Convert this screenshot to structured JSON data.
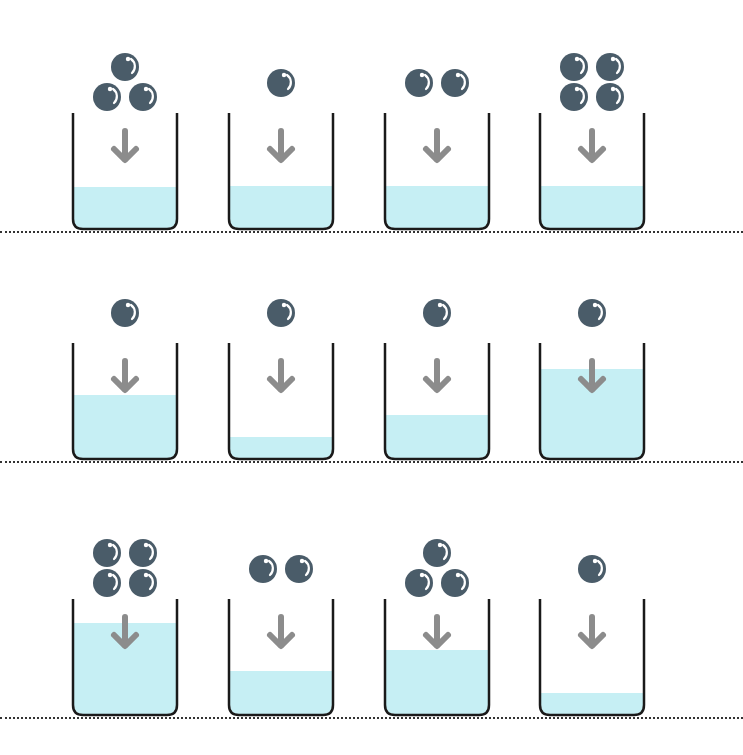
{
  "colors": {
    "ball": "#4a5c69",
    "ball_highlight": "#ffffff",
    "water": "#c6eff4",
    "arrow": "#8c8c8c",
    "beaker_outline": "#1a1a1a",
    "dotted_line": "#333333"
  },
  "rows": [
    {
      "baseline_y": 231,
      "beakers": [
        {
          "balls": 3,
          "water_level_pct": 36
        },
        {
          "balls": 1,
          "water_level_pct": 37
        },
        {
          "balls": 2,
          "water_level_pct": 37
        },
        {
          "balls": 4,
          "water_level_pct": 37
        }
      ]
    },
    {
      "baseline_y": 461,
      "beakers": [
        {
          "balls": 1,
          "water_level_pct": 55
        },
        {
          "balls": 1,
          "water_level_pct": 19
        },
        {
          "balls": 1,
          "water_level_pct": 38
        },
        {
          "balls": 1,
          "water_level_pct": 78
        }
      ]
    },
    {
      "baseline_y": 717,
      "beakers": [
        {
          "balls": 4,
          "water_level_pct": 79
        },
        {
          "balls": 2,
          "water_level_pct": 38
        },
        {
          "balls": 3,
          "water_level_pct": 56
        },
        {
          "balls": 1,
          "water_level_pct": 19
        }
      ]
    }
  ],
  "icons": {
    "ball": "ball-icon",
    "arrow": "arrow-down-icon",
    "beaker": "beaker-icon"
  }
}
